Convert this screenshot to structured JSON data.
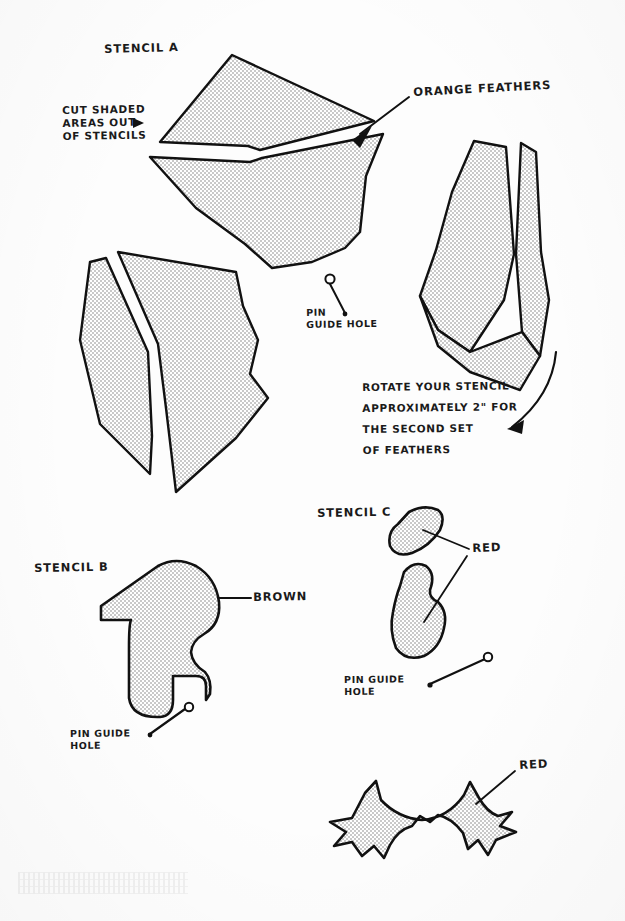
{
  "document": {
    "kind": "hand-drawn-stencil-instruction-sheet",
    "paper_color": "#fdfdfd",
    "ink_color": "#111111",
    "shading_fill": "#d9d9d9"
  },
  "labels": {
    "stencil_a": "STENCIL A",
    "cut_shaded": "CUT SHADED\nAREAS OUT\nOF STENCILS",
    "orange_feathers": "ORANGE FEATHERS",
    "pin_guide_hole_a": "PIN\nGUIDE HOLE",
    "rotate_note": "ROTATE YOUR STENCIL\nAPPROXIMATELY 2\" FOR\nTHE SECOND SET\nOF FEATHERS",
    "stencil_b": "STENCIL B",
    "brown": "BROWN",
    "pin_guide_hole_b": "PIN GUIDE\nHOLE",
    "stencil_c": "STENCIL C",
    "red_c": "RED",
    "pin_guide_hole_c": "PIN GUIDE\nHOLE",
    "red_feet": "RED"
  },
  "shapes": {
    "a_top_upper": "M232,55 L372,120 L257,150 L160,142 Z",
    "a_top_lower": "M150,155 L380,138 L362,170 L355,230 L330,250 L285,272 L245,245 L150,190 Z",
    "a_left_narrow": "M88,258 L110,262 L150,350 L155,440 L148,470 L95,420 L80,330 Z",
    "a_left_main": "M120,252 L230,268 L238,300 L258,340 L250,380 L268,400 L230,440 L172,492 L162,400 L152,330 Z",
    "a_right_main": "M470,140 L505,145 L512,150 L520,260 L500,330 L470,370 L440,330 L425,300 L440,250 L452,190 Z",
    "a_right_sliver": "M520,142 L534,150 L540,250 L548,300 L540,355 L520,330 L518,250 Z",
    "b_body": "M103,605 L160,566 L175,560 L200,568 L215,588 L218,608 L210,625 L196,632 L192,648 L205,660 L208,672 L200,690 L182,710 L160,716 L138,706 L128,688 L127,650 L130,622 L103,620 Z",
    "c_top": "M408,512 L430,506 L442,512 L440,528 L424,544 L404,552 L392,546 L394,528 Z",
    "c_bottom": "M400,570 L418,562 L432,572 L430,592 L440,600 L444,622 L432,648 L412,656 L396,644 L392,612 L396,590 Z",
    "feet": "M364,800 L374,784 L382,798 L398,810 L414,812 L430,802 L440,786 L450,800 L462,818 L478,812 L492,806 L482,820 L472,836 L486,842 L470,848 L456,858 L452,844 L440,852 L438,836 L424,824 L406,826 L392,838 L388,852 L376,844 L366,856 L352,848 L338,852 L348,838 L344,824 L356,820 Z"
  },
  "annotation_lines": {
    "cut_shaded_arrow": "M135,120 L168,128",
    "orange_leader": "M362,132 L408,96",
    "pin_a_leader": "M330,282 L348,312",
    "rotate_arrow": "M555,355 L542,398 L512,428",
    "brown_leader": "M218,598 L250,598",
    "pin_b_leader": "M146,735 L186,710",
    "red_c_leader": "M422,528 L470,548",
    "red_c_leader2": "M424,620 L466,556",
    "pin_c_leader": "M428,684 L486,660",
    "red_feet_leader": "M478,806 L516,770"
  },
  "pin_holes": [
    {
      "name": "pin-hole-a",
      "cx": 330,
      "cy": 280,
      "r": 4
    },
    {
      "name": "pin-hole-b",
      "cx": 188,
      "cy": 708,
      "r": 4
    },
    {
      "name": "pin-hole-c",
      "cx": 488,
      "cy": 658,
      "r": 4
    }
  ]
}
